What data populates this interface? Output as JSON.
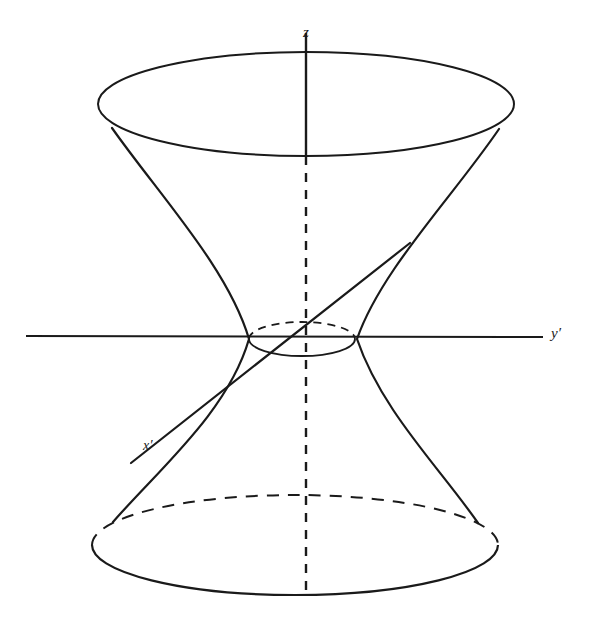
{
  "figure": {
    "type": "geometric-diagram",
    "background_color": "#ffffff",
    "stroke_color": "#1a1a1a"
  },
  "labels": {
    "z_axis": "z",
    "y_axis": "y′",
    "x_axis": "x′"
  },
  "axes": {
    "z": {
      "name": "vertical-axis",
      "label": "z",
      "solid_segment": {
        "x1": 306,
        "y1": 33,
        "x2": 306,
        "y2": 156
      },
      "dashed_segment": {
        "x1": 306,
        "y1": 156,
        "x2": 306,
        "y2": 594
      },
      "dash_pattern": "9 7"
    },
    "y": {
      "name": "horizontal-axis",
      "label": "y′",
      "segment": {
        "x1": 26,
        "y1": 336,
        "x2": 543,
        "y2": 337
      },
      "dash_pattern": "none"
    },
    "x": {
      "name": "oblique-axis",
      "label": "x′",
      "segment": {
        "x1": 131,
        "y1": 463,
        "x2": 410,
        "y2": 243
      },
      "dash_pattern": "none"
    }
  },
  "surface": {
    "top_ellipse": {
      "name": "top-rim",
      "cx": 306,
      "cy": 104,
      "rx": 208,
      "ry": 52,
      "front_style": "solid",
      "back_style": "solid"
    },
    "bottom_ellipse": {
      "name": "bottom-rim",
      "cx": 295,
      "cy": 545,
      "rx": 203,
      "ry": 50,
      "front_style": "solid",
      "back_style": "dashed"
    },
    "waist_ellipse": {
      "name": "waist",
      "cx": 302,
      "cy": 338,
      "rx": 53,
      "ry": 17,
      "front_style": "solid",
      "back_style": "dashed"
    },
    "left_branch": {
      "name": "left-hyperbola",
      "top": {
        "x": 112,
        "y": 128
      },
      "waist": {
        "x": 250,
        "y": 340
      },
      "bottom": {
        "x": 113,
        "y": 522
      }
    },
    "right_branch": {
      "name": "right-hyperbola",
      "top": {
        "x": 499,
        "y": 129
      },
      "waist": {
        "x": 356,
        "y": 340
      },
      "bottom": {
        "x": 476,
        "y": 522
      }
    }
  },
  "ruling_line": {
    "name": "generating-straight-line",
    "x1": 131,
    "y1": 463,
    "x2": 410,
    "y2": 243
  }
}
